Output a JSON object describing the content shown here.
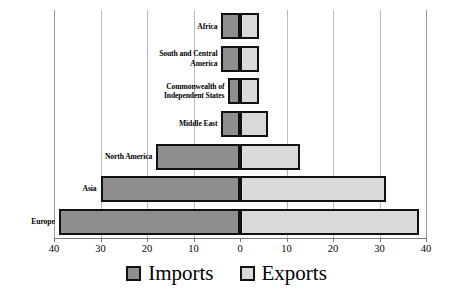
{
  "chart_data": {
    "type": "bar",
    "orientation": "horizontal",
    "subtype": "diverging-population-pyramid",
    "title": "",
    "xlabel": "",
    "ylabel": "",
    "xlim": [
      -40,
      40
    ],
    "xticks": [
      -40,
      -30,
      -20,
      -10,
      0,
      10,
      20,
      30,
      40
    ],
    "xtick_labels": [
      "40",
      "30",
      "20",
      "10",
      "0",
      "10",
      "20",
      "30",
      "40"
    ],
    "grid": true,
    "grid_axis": "x",
    "legend_position": "bottom",
    "categories": [
      "Africa",
      "South and Central America",
      "Commonwealth of Independent States",
      "Middle East",
      "North America",
      "Asia",
      "Europe"
    ],
    "series": [
      {
        "name": "Imports",
        "color": "#8e8e8e",
        "direction": "left",
        "values": [
          4.0,
          4.0,
          2.5,
          4.0,
          18.0,
          30.0,
          39.0
        ]
      },
      {
        "name": "Exports",
        "color": "#d9d9d9",
        "direction": "right",
        "values": [
          4.0,
          4.0,
          4.0,
          6.0,
          13.0,
          31.5,
          38.5
        ]
      }
    ]
  },
  "axis": {
    "tick_labels": [
      "40",
      "30",
      "20",
      "10",
      "0",
      "10",
      "20",
      "30",
      "40"
    ]
  },
  "categories": [
    {
      "lines": [
        "Africa"
      ]
    },
    {
      "lines": [
        "South and Central",
        "America"
      ]
    },
    {
      "lines": [
        "Commonwealth of",
        "Independent States"
      ]
    },
    {
      "lines": [
        "Middle East"
      ]
    },
    {
      "lines": [
        "North America"
      ]
    },
    {
      "lines": [
        "Asia"
      ]
    },
    {
      "lines": [
        "Europe"
      ]
    }
  ],
  "legend": {
    "items": [
      {
        "label": "Imports",
        "color": "#8e8e8e"
      },
      {
        "label": "Exports",
        "color": "#d9d9d9"
      }
    ]
  },
  "colors": {
    "imports": "#8e8e8e",
    "exports": "#d9d9d9",
    "bar_outline": "#111111",
    "gridline": "#b9b9b9",
    "axis": "#7a7a7a",
    "background": "#ffffff"
  }
}
